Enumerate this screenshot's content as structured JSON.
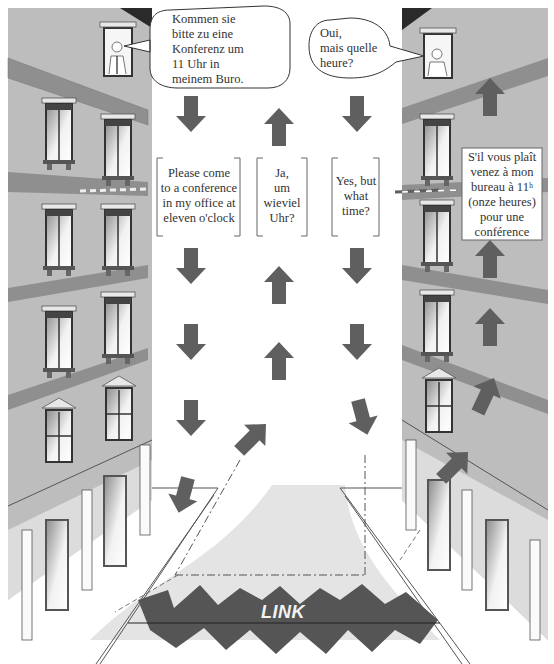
{
  "diagram": {
    "type": "interpreting-link-illustration",
    "speech_bubbles": {
      "german_speaker": "Kommen sie\nbitte zu eine\nKonferenz um\n11 Uhr in\nmeinem Buro.",
      "french_speaker": "Oui,\nmais quelle\nheure?"
    },
    "boxes": {
      "english_request": "Please come\nto a conference\nin my office at\neleven o'clock",
      "german_reply": "Ja,\num\nwieviel\nUhr?",
      "english_reply": "Yes, but\nwhat\ntime?",
      "french_request": "S'il vous plaît\nvenez à mon\nbureau à 11ʰ\n(onze heures)\npour une\nconférence"
    },
    "link_label": "LINK",
    "colors": {
      "building": "#b9b9b9",
      "band": "#8f8f8f",
      "arrow": "#5f5f5f",
      "link": "#555555",
      "floor_shade": "#e4e4e4",
      "roof": "#2a2a2a"
    },
    "arrows": {
      "column_1": "down",
      "column_2": "up",
      "column_3": "down",
      "column_4": "up"
    }
  }
}
